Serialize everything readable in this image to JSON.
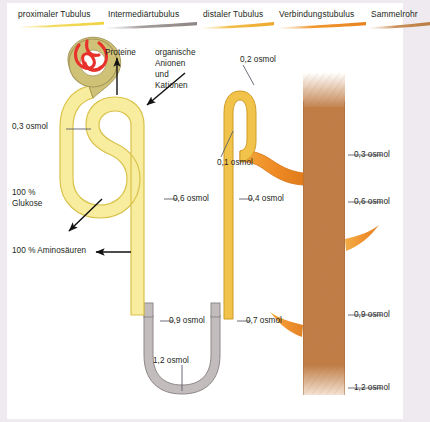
{
  "figure": {
    "background": "#efeaf0",
    "panel_background": "#ffffff"
  },
  "header": {
    "segments": [
      {
        "label": "proximaler Tubulus",
        "color": "#f5e27a",
        "x": 18,
        "y": 9,
        "rule_x": 18,
        "rule_y": 21,
        "rule_w": 86
      },
      {
        "label": "Intermediärtubulus",
        "color": "#a8a2a0",
        "x": 111,
        "y": 9,
        "rule_x": 106,
        "rule_y": 21,
        "rule_w": 90
      },
      {
        "label": "distaler Tubulus",
        "color": "#f0b93c",
        "x": 205,
        "y": 9,
        "rule_x": 200,
        "rule_y": 21,
        "rule_w": 72
      },
      {
        "label": "Verbindungstubulus",
        "color": "#ef8b2c",
        "x": 281,
        "y": 9,
        "rule_x": 276,
        "rule_y": 21,
        "rule_w": 88
      },
      {
        "label": "Sammelrohr",
        "color": "#c07d46",
        "x": 373,
        "y": 9,
        "rule_x": 368,
        "rule_y": 21,
        "rule_w": 60
      }
    ]
  },
  "annotations": {
    "left": [
      {
        "name": "osmol-0-3-left",
        "text": "0,3 osmol",
        "x": 12,
        "y": 123
      },
      {
        "name": "glucose-100",
        "text": "100 %",
        "x": 12,
        "y": 189
      },
      {
        "name": "glucose-100-line2",
        "text": "Glukose",
        "x": 12,
        "y": 200
      },
      {
        "name": "aminoacids-100",
        "text": "100 % Aminoäuren",
        "x": 12,
        "y": 243
      }
    ],
    "left_full": {
      "aminoacids": "100 % Aminosäuren"
    },
    "top": [
      {
        "name": "proteine",
        "text": "Proteine",
        "x": 107,
        "y": 50
      },
      {
        "name": "organische-anionen-1",
        "text": "organische",
        "x": 157,
        "y": 50
      },
      {
        "name": "organische-anionen-2",
        "text": "Anionen",
        "x": 157,
        "y": 61
      },
      {
        "name": "organische-anionen-3",
        "text": "und",
        "x": 157,
        "y": 72
      },
      {
        "name": "organische-anionen-4",
        "text": "Kationen",
        "x": 157,
        "y": 83
      }
    ],
    "center": [
      {
        "name": "osmol-0-6-prox",
        "text": "0,6 osmol",
        "x": 167,
        "y": 195
      },
      {
        "name": "osmol-0-4-dist",
        "text": "0,4 osmol",
        "x": 242,
        "y": 195
      },
      {
        "name": "osmol-0-9-desc",
        "text": "0,9 osmol",
        "x": 163,
        "y": 316
      },
      {
        "name": "osmol-0-7-asc",
        "text": "0,7 osmol",
        "x": 240,
        "y": 316
      },
      {
        "name": "osmol-1-2-loop",
        "text": "1,2 osmol",
        "x": 158,
        "y": 358
      }
    ],
    "distal": [
      {
        "name": "osmol-0-2-distal",
        "text": "0,2 osmol",
        "x": 243,
        "y": 57
      },
      {
        "name": "osmol-0-1-distal",
        "text": "0,1 osmol",
        "x": 221,
        "y": 158
      }
    ],
    "right": [
      {
        "name": "osmol-0-3-duct",
        "text": "0,3 osmol",
        "x": 355,
        "y": 151
      },
      {
        "name": "osmol-0-6-duct",
        "text": "0,6 osmol",
        "x": 355,
        "y": 198
      },
      {
        "name": "osmol-0-9-duct",
        "text": "0,9 osmol",
        "x": 355,
        "y": 311
      },
      {
        "name": "osmol-1-2-duct",
        "text": "1,2 osmol",
        "x": 355,
        "y": 384
      }
    ]
  },
  "colors": {
    "proximal_fill": "#f8ec9e",
    "proximal_stroke": "#d9c24a",
    "glomerulus_fill": "#cfc276",
    "glomerulus_stroke": "#a5975a",
    "capillary": "#e8312a",
    "intermediate_fill": "#c3bcbd",
    "intermediate_stroke": "#8e8789",
    "distal_fill": "#f2c34a",
    "distal_stroke": "#cf9a27",
    "connecting_fill": "#f08a2a",
    "collecting_fill": "#c07d46",
    "leader": "#5a5f6a",
    "arrow": "#111111",
    "text": "#231f20"
  }
}
